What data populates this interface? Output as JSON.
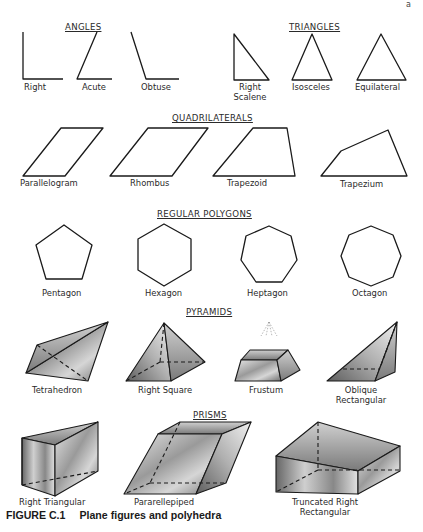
{
  "page_marker": "a",
  "sections": {
    "angles": {
      "title": "ANGLES",
      "items": [
        {
          "label": "Right"
        },
        {
          "label": "Acute"
        },
        {
          "label": "Obtuse"
        }
      ]
    },
    "triangles": {
      "title": "TRIANGLES",
      "items": [
        {
          "label": "Right",
          "label2": "Scalene"
        },
        {
          "label": "Isosceles"
        },
        {
          "label": "Equilateral"
        }
      ]
    },
    "quadrilaterals": {
      "title": "QUADRILATERALS",
      "items": [
        {
          "label": "Parallelogram"
        },
        {
          "label": "Rhombus"
        },
        {
          "label": "Trapezoid"
        },
        {
          "label": "Trapezium"
        }
      ]
    },
    "regular_polygons": {
      "title": "REGULAR  POLYGONS",
      "items": [
        {
          "label": "Pentagon"
        },
        {
          "label": "Hexagon"
        },
        {
          "label": "Heptagon"
        },
        {
          "label": "Octagon"
        }
      ]
    },
    "pyramids": {
      "title": "PYRAMIDS",
      "items": [
        {
          "label": "Tetrahedron"
        },
        {
          "label": "Right Square"
        },
        {
          "label": "Frustum"
        },
        {
          "label": "Oblique",
          "label2": "Rectangular"
        }
      ]
    },
    "prisms": {
      "title": "PRISMS",
      "items": [
        {
          "label": "Right  Triangular"
        },
        {
          "label": "Pararellepiped"
        },
        {
          "label": "Truncated  Right",
          "label2": "Rectangular"
        }
      ]
    }
  },
  "caption": {
    "number": "FIGURE C.1",
    "text": "Plane figures and polyhedra"
  }
}
